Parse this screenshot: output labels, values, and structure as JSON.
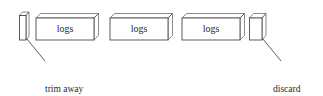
{
  "figure": {
    "type": "technical-illustration",
    "background_color": "#ffffff",
    "line_color": "#4a4a4a",
    "text_color": "#2b2b2b"
  },
  "shapes": {
    "selvage_strip": {
      "name": "selvage-strip",
      "kind": "thin-vertical-strip",
      "front": {
        "x": 19.5,
        "y": 15.5,
        "w": 6.5,
        "h": 24.5
      },
      "depth_dx": 3.0,
      "depth_dy": -3.5
    },
    "log_blocks": [
      {
        "label": "logs",
        "front": {
          "x": 36.0,
          "y": 18.0,
          "w": 58.0,
          "h": 22.0
        },
        "depth_dx": 4.5,
        "depth_dy": -4.5
      },
      {
        "label": "logs",
        "front": {
          "x": 110.0,
          "y": 18.0,
          "w": 58.0,
          "h": 22.0
        },
        "depth_dx": 4.5,
        "depth_dy": -4.5
      },
      {
        "label": "logs",
        "front": {
          "x": 182.0,
          "y": 18.0,
          "w": 58.0,
          "h": 22.0
        },
        "depth_dx": 4.5,
        "depth_dy": -4.5
      }
    ],
    "discard_crease": {
      "name": "discard-crease-piece",
      "kind": "folded-narrow-panel",
      "front": {
        "x": 249.5,
        "y": 18.0,
        "w": 12.5,
        "h": 22.0
      },
      "depth_dx": 4.0,
      "depth_dy": -4.5
    }
  },
  "callouts": [
    {
      "id": "trim-away-selvage",
      "line1": "trim away",
      "line2": "selvage",
      "leader": {
        "x1": 26.5,
        "y1": 38.5,
        "x2": 45.0,
        "y2": 61.0
      }
    },
    {
      "id": "discard-crease",
      "line1": "discard",
      "line2": "crease",
      "leader": {
        "x1": 262.5,
        "y1": 38.5,
        "x2": 281.0,
        "y2": 61.0
      }
    }
  ]
}
